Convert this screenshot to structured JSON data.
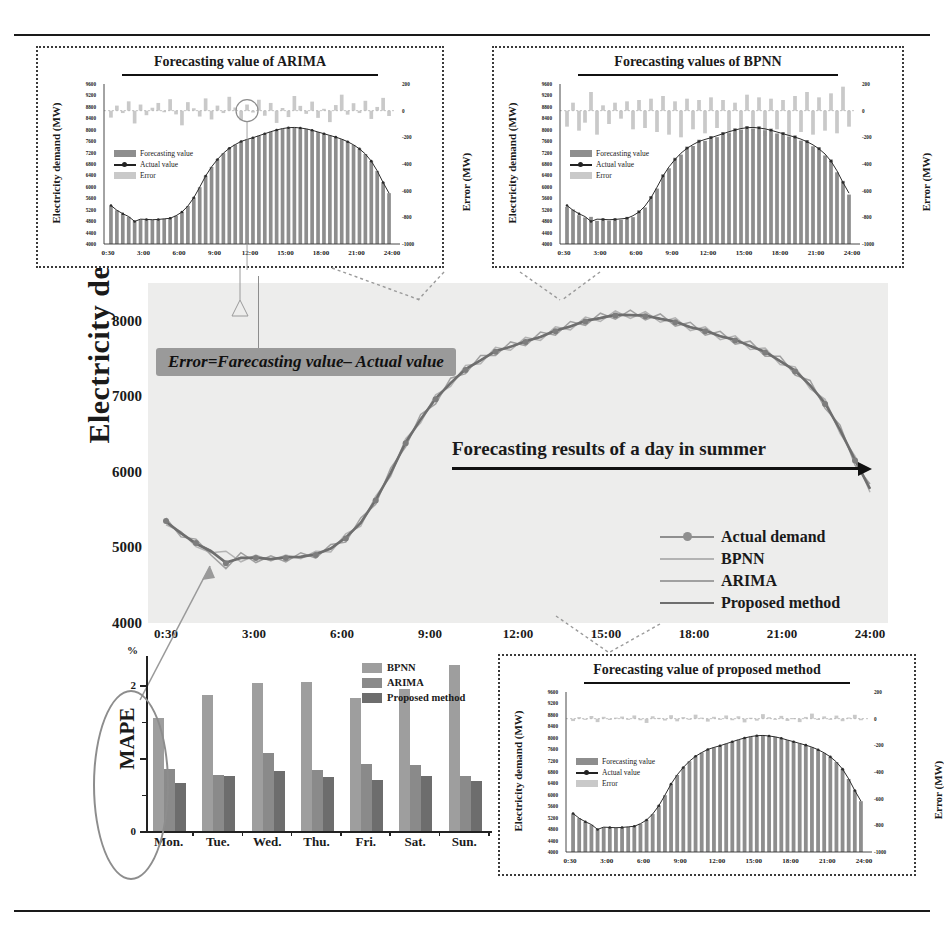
{
  "figure": {
    "main_ylabel": "Electricity demand",
    "annotation_arrow": "Forecasting  results of a day in summer",
    "callout": "Error=Farecasting value– Actual value"
  },
  "chart_data": [
    {
      "id": "main",
      "type": "line",
      "title": "",
      "xlabel": "",
      "ylabel": "Electricity demand",
      "ylim": [
        4000,
        8500
      ],
      "yticks": [
        8000,
        7000,
        6000,
        5000,
        4000
      ],
      "xticks": [
        "0:30",
        "3:00",
        "6:00",
        "9:00",
        "12:00",
        "15:00",
        "18:00",
        "21:00",
        "24:00"
      ],
      "grid": false,
      "legend_position": "lower-right",
      "legend": [
        "Actual demand",
        "BPNN",
        "ARIMA",
        "Proposed method"
      ],
      "x": [
        "0:30",
        "1:00",
        "1:30",
        "2:00",
        "2:30",
        "3:00",
        "3:30",
        "4:00",
        "4:30",
        "5:00",
        "5:30",
        "6:00",
        "6:30",
        "7:00",
        "7:30",
        "8:00",
        "8:30",
        "9:00",
        "9:30",
        "10:00",
        "10:30",
        "11:00",
        "11:30",
        "12:00",
        "12:30",
        "13:00",
        "13:30",
        "14:00",
        "14:30",
        "15:00",
        "15:30",
        "16:00",
        "16:30",
        "17:00",
        "17:30",
        "18:00",
        "18:30",
        "19:00",
        "19:30",
        "20:00",
        "20:30",
        "21:00",
        "21:30",
        "22:00",
        "22:30",
        "23:00",
        "23:30",
        "24:00"
      ],
      "series": [
        {
          "name": "Actual demand",
          "color": "#8f8f8f",
          "values": [
            5350,
            5180,
            5060,
            4960,
            4790,
            4870,
            4860,
            4850,
            4860,
            4880,
            4900,
            4990,
            5120,
            5330,
            5620,
            5990,
            6380,
            6700,
            6960,
            7180,
            7350,
            7480,
            7590,
            7660,
            7720,
            7790,
            7860,
            7930,
            7990,
            8040,
            8070,
            8080,
            8060,
            8030,
            7980,
            7920,
            7860,
            7800,
            7740,
            7670,
            7580,
            7470,
            7330,
            7150,
            6900,
            6560,
            6150,
            5780
          ]
        },
        {
          "name": "BPNN",
          "color": "#b3b3b3",
          "values": [
            5300,
            5210,
            5010,
            4930,
            4950,
            4810,
            4900,
            4820,
            4900,
            4850,
            4950,
            4940,
            5180,
            5280,
            5680,
            5940,
            6440,
            6650,
            7020,
            7130,
            7410,
            7430,
            7650,
            7610,
            7780,
            7740,
            7920,
            7880,
            8050,
            7990,
            8130,
            8030,
            8120,
            7980,
            8040,
            7870,
            7920,
            7750,
            7800,
            7620,
            7640,
            7420,
            7390,
            7100,
            6960,
            6510,
            6210,
            5730
          ]
        },
        {
          "name": "ARIMA",
          "color": "#a0a0a0",
          "values": [
            5390,
            5140,
            5110,
            4900,
            4720,
            4930,
            4800,
            4890,
            4810,
            4930,
            4860,
            5040,
            5070,
            5390,
            5570,
            6050,
            6330,
            6760,
            6900,
            7240,
            7300,
            7540,
            7540,
            7720,
            7670,
            7850,
            7810,
            7990,
            7940,
            8100,
            8020,
            8140,
            8010,
            8090,
            7930,
            7980,
            7810,
            7860,
            7690,
            7730,
            7530,
            7530,
            7280,
            7210,
            6840,
            6620,
            6090,
            5840
          ]
        },
        {
          "name": "Proposed method",
          "color": "#6e6e6e",
          "values": [
            5340,
            5190,
            5050,
            4950,
            4800,
            4860,
            4865,
            4845,
            4870,
            4875,
            4910,
            4985,
            5130,
            5325,
            5630,
            5985,
            6390,
            6695,
            6970,
            7175,
            7360,
            7475,
            7600,
            7655,
            7730,
            7785,
            7870,
            7925,
            8000,
            8035,
            8080,
            8075,
            8070,
            8025,
            7990,
            7915,
            7870,
            7795,
            7750,
            7665,
            7590,
            7465,
            7340,
            7145,
            6910,
            6555,
            6160,
            5775
          ]
        }
      ]
    },
    {
      "id": "mape",
      "type": "bar",
      "title": "",
      "ylabel": "MAPE",
      "yunit": "%",
      "ylim": [
        0,
        2.4
      ],
      "yticks": [
        0,
        1,
        2
      ],
      "ytick_labels": [
        "0",
        "",
        "2"
      ],
      "categories": [
        "Mon.",
        "Tue.",
        "Wed.",
        "Thu.",
        "Fri.",
        "Sat.",
        "Sun."
      ],
      "legend": [
        "BPNN",
        "ARIMA",
        "Proposed method"
      ],
      "legend_position": "upper-right",
      "series": [
        {
          "name": "BPNN",
          "color": "#9e9e9e",
          "values": [
            1.55,
            1.87,
            2.03,
            2.05,
            1.82,
            1.95,
            2.28
          ]
        },
        {
          "name": "ARIMA",
          "color": "#8a8a8a",
          "values": [
            0.85,
            0.77,
            1.07,
            0.83,
            0.92,
            0.9,
            0.76
          ]
        },
        {
          "name": "Proposed method",
          "color": "#6d6d6d",
          "values": [
            0.66,
            0.75,
            0.82,
            0.74,
            0.7,
            0.75,
            0.68
          ]
        }
      ]
    },
    {
      "id": "inset-arima",
      "type": "bar",
      "title": "Forecasting value of ARIMA",
      "ylabel": "Electricity demand (MW)",
      "y2label": "Error (MW)",
      "ylim": [
        4000,
        9600
      ],
      "yticks": [
        9600,
        9200,
        8800,
        8400,
        8000,
        7600,
        7200,
        6800,
        6400,
        6000,
        5600,
        5200,
        4800,
        4400,
        4000
      ],
      "y2lim": [
        -1000,
        200
      ],
      "y2ticks": [
        200,
        0,
        -200,
        -400,
        -600,
        -800,
        -1000
      ],
      "xticks": [
        "0:30",
        "3:00",
        "6:00",
        "9:00",
        "12:00",
        "15:00",
        "18:00",
        "21:00",
        "24:00"
      ],
      "legend": [
        "Forecasting value",
        "Actual value",
        "Error"
      ],
      "legend_position": "left-middle",
      "forecast_values": [
        5340,
        5180,
        5050,
        4950,
        4800,
        4860,
        4860,
        4850,
        4870,
        4880,
        4910,
        4990,
        5130,
        5330,
        5630,
        5990,
        6390,
        6700,
        6970,
        7180,
        7360,
        7480,
        7600,
        7660,
        7730,
        7790,
        7870,
        7930,
        8000,
        8040,
        8080,
        8080,
        8070,
        8030,
        7990,
        7920,
        7870,
        7800,
        7750,
        7670,
        7590,
        7470,
        7340,
        7150,
        6910,
        6560,
        6160,
        5780
      ],
      "actual_values": [
        5350,
        5180,
        5060,
        4960,
        4790,
        4870,
        4860,
        4850,
        4860,
        4880,
        4900,
        4990,
        5120,
        5330,
        5620,
        5990,
        6380,
        6700,
        6960,
        7180,
        7350,
        7480,
        7590,
        7660,
        7720,
        7790,
        7860,
        7930,
        7990,
        8040,
        8070,
        8080,
        8060,
        8030,
        7980,
        7920,
        7860,
        7800,
        7740,
        7670,
        7580,
        7470,
        7330,
        7150,
        6900,
        6560,
        6150,
        5780
      ],
      "error_values": [
        -52,
        38,
        -18,
        70,
        -96,
        46,
        -34,
        22,
        58,
        -12,
        86,
        -28,
        -110,
        64,
        18,
        -44,
        92,
        -66,
        38,
        -18,
        104,
        24,
        -72,
        46,
        -14,
        82,
        -38,
        58,
        -92,
        20,
        -48,
        110,
        36,
        -24,
        68,
        -54,
        14,
        -86,
        42,
        120,
        -30,
        56,
        -18,
        74,
        -62,
        28,
        96,
        -40
      ]
    },
    {
      "id": "inset-bpnn",
      "type": "bar",
      "title": "Forecasting values of BPNN",
      "ylabel": "Electricity demand (MW)",
      "y2label": "Error (MW)",
      "ylim": [
        4000,
        9600
      ],
      "yticks": [
        9600,
        9200,
        8800,
        8400,
        8000,
        7600,
        7200,
        6800,
        6400,
        6000,
        5600,
        5200,
        4800,
        4400,
        4000
      ],
      "y2lim": [
        -1000,
        200
      ],
      "y2ticks": [
        200,
        0,
        -200,
        -400,
        -600,
        -800,
        -1000
      ],
      "xticks": [
        "0:30",
        "3:00",
        "6:00",
        "9:00",
        "12:00",
        "15:00",
        "18:00",
        "21:00",
        "24:00"
      ],
      "legend": [
        "Forecasting value",
        "Actual value",
        "Error"
      ],
      "legend_position": "left-middle",
      "forecast_values": [
        5300,
        5210,
        5010,
        4930,
        4950,
        4810,
        4900,
        4820,
        4900,
        4850,
        4950,
        4940,
        5180,
        5280,
        5680,
        5940,
        6440,
        6650,
        7020,
        7130,
        7410,
        7430,
        7650,
        7610,
        7780,
        7740,
        7920,
        7880,
        8050,
        7990,
        8130,
        8030,
        8120,
        7980,
        8040,
        7870,
        7920,
        7750,
        7800,
        7620,
        7640,
        7420,
        7390,
        7100,
        6960,
        6510,
        6210,
        5730
      ],
      "actual_values": [
        5350,
        5180,
        5060,
        4960,
        4790,
        4870,
        4860,
        4850,
        4860,
        4880,
        4900,
        4990,
        5120,
        5330,
        5620,
        5990,
        6380,
        6700,
        6960,
        7180,
        7350,
        7480,
        7590,
        7660,
        7720,
        7790,
        7860,
        7930,
        7990,
        8040,
        8070,
        8080,
        8060,
        8030,
        7980,
        7920,
        7860,
        7800,
        7740,
        7670,
        7580,
        7470,
        7330,
        7150,
        6900,
        6560,
        6150,
        5780
      ],
      "error_values": [
        -120,
        60,
        -150,
        -90,
        140,
        -180,
        40,
        -100,
        60,
        -60,
        70,
        -140,
        80,
        -130,
        90,
        -160,
        110,
        -180,
        70,
        -200,
        90,
        -140,
        80,
        -170,
        100,
        -130,
        80,
        -190,
        60,
        -170,
        120,
        -150,
        100,
        -190,
        90,
        -140,
        80,
        -200,
        110,
        -160,
        140,
        -180,
        100,
        -150,
        130,
        -170,
        180,
        -120
      ]
    },
    {
      "id": "inset-proposed",
      "type": "bar",
      "title": "Forecasting value of proposed method",
      "ylabel": "Electricity demand (MW)",
      "y2label": "Error (MW)",
      "ylim": [
        4000,
        9600
      ],
      "yticks": [
        9600,
        9200,
        8800,
        8400,
        8000,
        7600,
        7200,
        6800,
        6400,
        6000,
        5600,
        5200,
        4800,
        4400,
        4000
      ],
      "y2lim": [
        -1000,
        200
      ],
      "y2ticks": [
        200,
        0,
        -200,
        -400,
        -600,
        -800,
        -1000
      ],
      "xticks": [
        "0:30",
        "3:00",
        "6:00",
        "9:00",
        "12:00",
        "15:00",
        "18:00",
        "21:00",
        "24:00"
      ],
      "legend": [
        "Forecasting value",
        "Actual value",
        "Error"
      ],
      "legend_position": "left-middle",
      "forecast_values": [
        5345,
        5185,
        5055,
        4955,
        4795,
        4865,
        4862,
        4848,
        4865,
        4878,
        4905,
        4988,
        5125,
        5328,
        5625,
        5988,
        6385,
        6698,
        6965,
        7178,
        7355,
        7478,
        7595,
        7658,
        7725,
        7788,
        7865,
        7928,
        7995,
        8038,
        8075,
        8078,
        8065,
        8028,
        7985,
        7918,
        7865,
        7798,
        7745,
        7668,
        7585,
        7468,
        7335,
        7148,
        6905,
        6558,
        6155,
        5778
      ],
      "actual_values": [
        5350,
        5180,
        5060,
        4960,
        4790,
        4870,
        4860,
        4850,
        4860,
        4880,
        4900,
        4990,
        5120,
        5330,
        5620,
        5990,
        6380,
        6700,
        6960,
        7180,
        7350,
        7480,
        7590,
        7660,
        7720,
        7790,
        7860,
        7930,
        7990,
        8040,
        8070,
        8080,
        8060,
        8030,
        7980,
        7920,
        7860,
        7800,
        7740,
        7670,
        7580,
        7470,
        7330,
        7150,
        6900,
        6560,
        6150,
        5780
      ],
      "error_values": [
        -18,
        12,
        -8,
        20,
        -26,
        14,
        -10,
        8,
        16,
        -6,
        24,
        -12,
        -32,
        18,
        6,
        -14,
        26,
        -20,
        12,
        -6,
        30,
        8,
        -22,
        14,
        -5,
        24,
        -12,
        18,
        -28,
        7,
        -15,
        34,
        11,
        -8,
        21,
        -17,
        5,
        -26,
        13,
        38,
        -10,
        17,
        -6,
        23,
        -19,
        9,
        29,
        -12
      ]
    }
  ]
}
